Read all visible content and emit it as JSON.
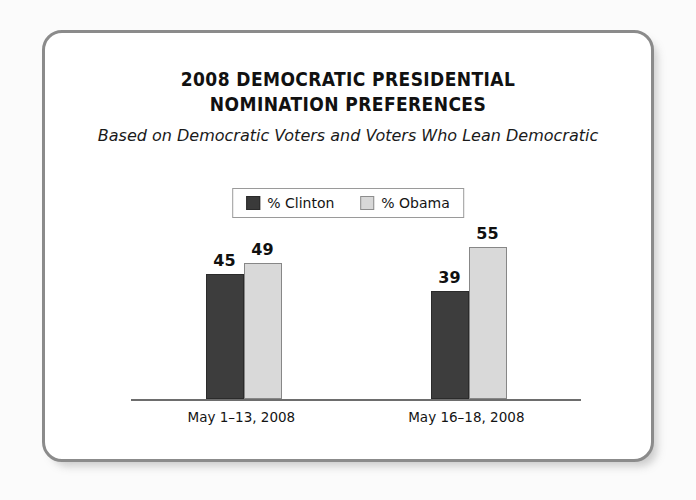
{
  "card": {
    "border_color": "#8b8b8b",
    "background": "#ffffff"
  },
  "header": {
    "title_line_1": "2008 DEMOCRATIC PRESIDENTIAL",
    "title_line_2": "NOMINATION PREFERENCES",
    "subtitle": "Based on Democratic Voters and Voters Who Lean Democratic"
  },
  "legend": {
    "items": [
      {
        "label": "% Clinton",
        "color": "#3d3d3d",
        "swatch": "dark"
      },
      {
        "label": "% Obama",
        "color": "#d9d9d9",
        "swatch": "light"
      }
    ]
  },
  "chart_data": {
    "type": "bar",
    "title": "2008 DEMOCRATIC PRESIDENTIAL NOMINATION PREFERENCES",
    "subtitle": "Based on Democratic Voters and Voters Who Lean Democratic",
    "xlabel": "",
    "ylabel": "",
    "ylim": [
      0,
      60
    ],
    "grid": false,
    "legend_position": "top-center",
    "categories": [
      "May 1–13, 2008",
      "May 16–18, 2008"
    ],
    "series": [
      {
        "name": "% Clinton",
        "color": "#3d3d3d",
        "values": [
          45,
          39
        ]
      },
      {
        "name": "% Obama",
        "color": "#d9d9d9",
        "values": [
          49,
          55
        ]
      }
    ],
    "data_labels": [
      "45",
      "49",
      "39",
      "55"
    ]
  },
  "groups": [
    {
      "category": "May 1–13, 2008",
      "bars": [
        {
          "series": "% Clinton",
          "value": 45,
          "label": "45",
          "swatch": "dark"
        },
        {
          "series": "% Obama",
          "value": 49,
          "label": "49",
          "swatch": "light"
        }
      ]
    },
    {
      "category": "May 16–18, 2008",
      "bars": [
        {
          "series": "% Clinton",
          "value": 39,
          "label": "39",
          "swatch": "dark"
        },
        {
          "series": "% Obama",
          "value": 55,
          "label": "55",
          "swatch": "light"
        }
      ]
    }
  ]
}
